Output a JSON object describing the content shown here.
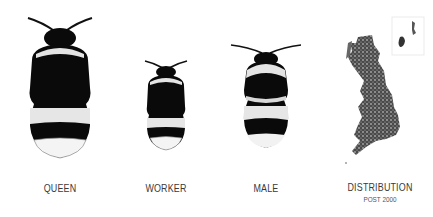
{
  "panels": [
    {
      "id": "queen",
      "label": "QUEEN",
      "icon": "bee-queen-icon"
    },
    {
      "id": "worker",
      "label": "WORKER",
      "icon": "bee-worker-icon"
    },
    {
      "id": "male",
      "label": "MALE",
      "icon": "bee-male-icon"
    },
    {
      "id": "distribution",
      "label": "DISTRIBUTION",
      "sublabel": "POST 2000",
      "icon": "uk-distribution-map-icon"
    }
  ],
  "colors": {
    "bee_black": "#0a0a0a",
    "bee_band": "#e4e4e4",
    "map_dots": "#3c3c3c",
    "text": "#3a3a3a"
  }
}
